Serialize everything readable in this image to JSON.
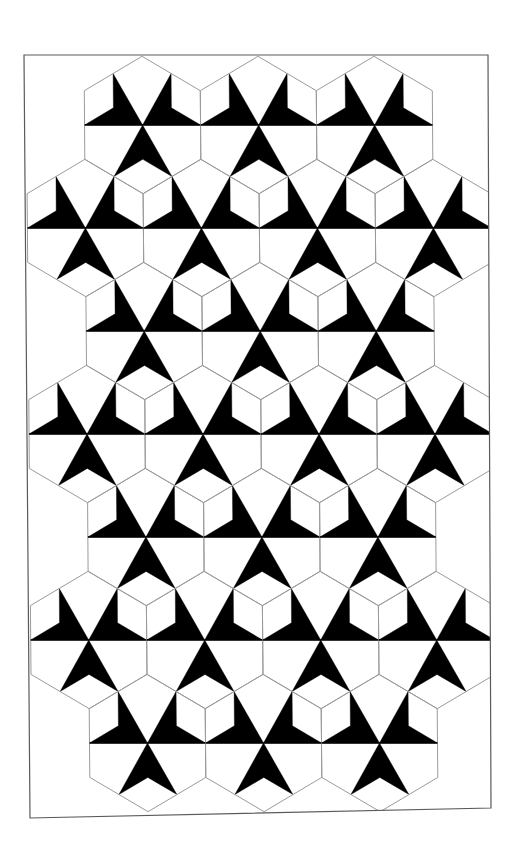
{
  "figure": {
    "colors": {
      "background": "#ffffff",
      "dart_fill": "#000000",
      "hex_outline": "#9a9a9a",
      "diameter_line": "#000000",
      "frame": "#5a5a5a"
    },
    "frame": {
      "points": [
        [
          24,
          55
        ],
        [
          488,
          55
        ],
        [
          491,
          808
        ],
        [
          30,
          818
        ]
      ]
    },
    "hex": {
      "half_width": 58,
      "radius": 68.7
    },
    "skew_x_per_px": 0.008,
    "skew_origin_y": 55,
    "rows": [
      {
        "y": 125,
        "xs": [
          142,
          258,
          374
        ]
      },
      {
        "y": 228,
        "xs": [
          84,
          200,
          316,
          432
        ]
      },
      {
        "y": 331,
        "xs": [
          142,
          258,
          374
        ]
      },
      {
        "y": 434,
        "xs": [
          84,
          200,
          316,
          432
        ]
      },
      {
        "y": 537,
        "xs": [
          142,
          258,
          374
        ]
      },
      {
        "y": 640,
        "xs": [
          84,
          200,
          316,
          432
        ]
      },
      {
        "y": 743,
        "xs": [
          142,
          258,
          374
        ]
      }
    ]
  }
}
